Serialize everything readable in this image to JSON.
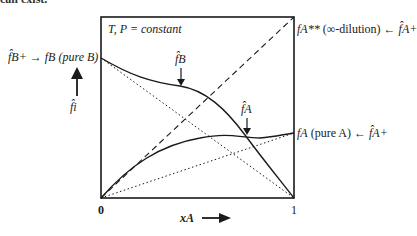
{
  "caption_fragment": "can exist.",
  "condition": "T, P = constant",
  "left_labels": {
    "top": {
      "lhs": "f̂B+",
      "arrow": "→",
      "rhs": "fB (pure B)"
    },
    "axis": "f̂i"
  },
  "right_labels": {
    "top": {
      "lhs": "fA**",
      "mid": "(∞-dilution)",
      "arrow": "←",
      "rhs": "f̂A+"
    },
    "mid": {
      "lhs": "fA",
      "mid": "(pure A)",
      "arrow": "←",
      "rhs": "f̂A+"
    }
  },
  "curve_labels": {
    "fB": "f̂B",
    "fA": "f̂A"
  },
  "x_axis": {
    "label": "xA",
    "ticks": [
      "0",
      "1"
    ]
  },
  "colors": {
    "ink": "#1a1a1a",
    "background": "#ffffff"
  }
}
